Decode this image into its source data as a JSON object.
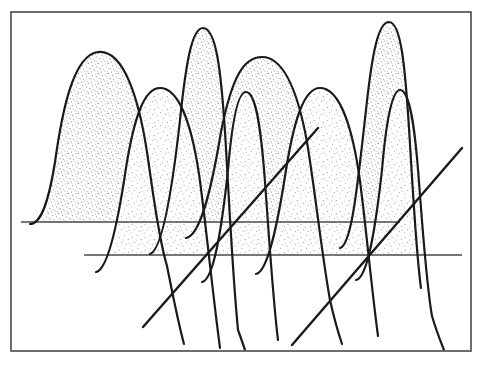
{
  "page": {
    "kind": "scanned-figure",
    "width": 483,
    "height": 365,
    "background_color": "#ffffff",
    "ink_color": "#1a1a1a",
    "frame_color": "#4a4a4a",
    "stipple_color": "#2b2b2b",
    "caption": "",
    "title": "",
    "scan_artifact_top": "descender marks of a cut-off text line above the figure"
  },
  "frame": {
    "name": "figure-border",
    "x": 11,
    "y": 12,
    "width": 460,
    "height": 339,
    "stroke_width": 1.6
  },
  "chart_data": {
    "type": "area",
    "title": "",
    "subtitle": "",
    "xlabel": "",
    "ylabel": "",
    "grid": false,
    "legend": false,
    "legend_position": "none",
    "style": "hand-drawn stippled overlapping gaussian peaks on offset baselines (pseudo-3D ridgeline)",
    "xlim": [
      11,
      471
    ],
    "ylim": [
      351,
      12
    ],
    "baselines": [
      {
        "name": "rear-baseline",
        "row": 0,
        "y": 222,
        "x_start": 21,
        "x_end": 400
      },
      {
        "name": "front-baseline",
        "row": 1,
        "y": 255,
        "x_start": 84,
        "x_end": 462
      }
    ],
    "depth_axes": [
      {
        "name": "depth-axis-left",
        "x1": 143,
        "y1": 327,
        "x2": 318,
        "y2": 128
      },
      {
        "name": "depth-axis-right",
        "x1": 292,
        "y1": 345,
        "x2": 462,
        "y2": 148
      }
    ],
    "series": [
      {
        "name": "rear-row-peaks",
        "baseline_row": 0,
        "baseline_y": 222,
        "fill": "stipple",
        "peaks": [
          {
            "label": "peak-1",
            "center": 98,
            "apex_y": 52,
            "height": 170,
            "half_width": 58,
            "flat_top": 30
          },
          {
            "label": "peak-2",
            "center": 200,
            "apex_y": 28,
            "height": 194,
            "half_width": 38,
            "flat_top": 22
          },
          {
            "label": "peak-3",
            "center": 260,
            "apex_y": 57,
            "height": 165,
            "half_width": 62,
            "flat_top": 34
          },
          {
            "label": "peak-4",
            "center": 385,
            "apex_y": 22,
            "height": 200,
            "half_width": 40,
            "flat_top": 24
          }
        ]
      },
      {
        "name": "front-row-peaks",
        "baseline_row": 1,
        "baseline_y": 255,
        "fill": "stipple",
        "peaks": [
          {
            "label": "peak-5",
            "center": 158,
            "apex_y": 88,
            "height": 167,
            "half_width": 46,
            "flat_top": 24
          },
          {
            "label": "peak-6",
            "center": 235,
            "apex_y": 92,
            "height": 163,
            "half_width": 32,
            "flat_top": 18
          },
          {
            "label": "peak-7",
            "center": 318,
            "apex_y": 88,
            "height": 167,
            "half_width": 45,
            "flat_top": 24
          },
          {
            "label": "peak-8",
            "center": 392,
            "apex_y": 90,
            "height": 165,
            "half_width": 30,
            "flat_top": 18
          }
        ]
      }
    ],
    "annotations": [],
    "tick_labels_x": [],
    "tick_labels_y": []
  }
}
